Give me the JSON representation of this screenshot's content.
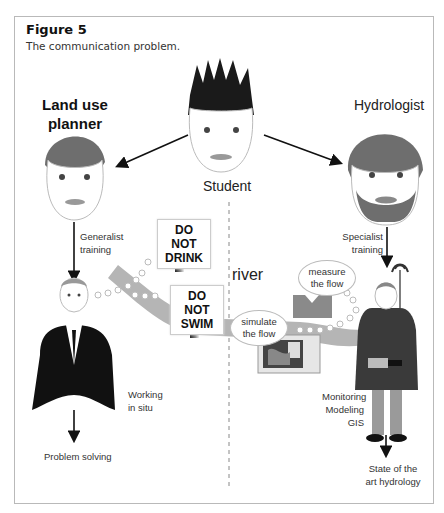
{
  "figure": {
    "title": "Figure 5",
    "subtitle": "The communication problem."
  },
  "roles": {
    "land_use_planner": "Land use\nplanner",
    "student": "Student",
    "hydrologist": "Hydrologist"
  },
  "labels": {
    "generalist_training_1": "Generalist",
    "generalist_training_2": "training",
    "specialist_training_1": "Specialist",
    "specialist_training_2": "training",
    "working_1": "Working",
    "working_2": "in situ",
    "problem_solving": "Problem solving",
    "monitoring": "Monitoring",
    "modeling": "Modeling",
    "gis": "GIS",
    "state_1": "State of the",
    "state_2": "art hydrology",
    "river": "river"
  },
  "signs": {
    "drink_1": "DO NOT",
    "drink_2": "DRINK",
    "swim_1": "DO NOT",
    "swim_2": "SWIM"
  },
  "bubbles": {
    "measure_1": "measure",
    "measure_2": "the flow",
    "simulate_1": "simulate",
    "simulate_2": "the flow"
  },
  "colors": {
    "river": "#b5b5b5",
    "dark_hair": "#1a1a1a",
    "grey_hair": "#6e6e6e",
    "suit": "#111111",
    "hydrologist_jacket": "#3a3a3a",
    "hydrologist_pants": "#9a9a9a",
    "weir": "#8a8a8a"
  }
}
